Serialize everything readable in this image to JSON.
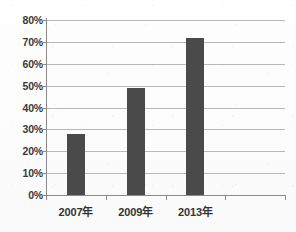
{
  "chart_data": {
    "type": "bar",
    "title": "",
    "subtitle": "",
    "xlabel": "",
    "ylabel": "",
    "categories": [
      "2007年",
      "2009年",
      "2013年"
    ],
    "values": [
      28,
      49,
      72
    ],
    "value_suffix": "%",
    "ylim": [
      0,
      80
    ],
    "ytick_step": 10,
    "ytick_labels": [
      "0%",
      "10%",
      "20%",
      "30%",
      "40%",
      "50%",
      "60%",
      "70%",
      "80%"
    ],
    "ytick_values": [
      0,
      10,
      20,
      30,
      40,
      50,
      60,
      70,
      80
    ],
    "grid": true,
    "grid_axis": "y",
    "legend": false,
    "legend_position": "none",
    "series": [
      {
        "name": "",
        "values": [
          28,
          49,
          72
        ]
      }
    ],
    "empty_trailing_category_slot": true,
    "annotations": []
  },
  "colors": {
    "bar": "#4a4a4a",
    "gridline": "#b9b9b9",
    "axis": "#8a8a8a",
    "tick_label": "#3a3a3a",
    "category_label": "#333333",
    "background": "#fdfdfd"
  }
}
